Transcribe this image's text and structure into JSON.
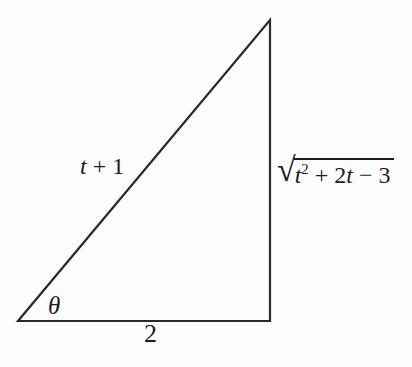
{
  "figure": {
    "background_color": "#fcfcfc",
    "line_color": "#2a2a2a",
    "line_width": "2.2",
    "triangle_points": "18,321 270,321 270,20",
    "labels": {
      "hypotenuse": {
        "parts": [
          {
            "text": "t",
            "style": "var"
          },
          {
            "text": " + 1",
            "style": ""
          }
        ]
      },
      "vertical_side": {
        "radical_sign": "√",
        "radicand_parts": [
          {
            "text": "t",
            "style": "var"
          },
          {
            "text": "2",
            "style": "sup"
          },
          {
            "text": " + 2",
            "style": ""
          },
          {
            "text": "t",
            "style": "var"
          },
          {
            "text": " − 3",
            "style": ""
          }
        ]
      },
      "base": {
        "text": "2"
      },
      "angle": {
        "parts": [
          {
            "text": "θ",
            "style": "var"
          }
        ]
      }
    }
  }
}
